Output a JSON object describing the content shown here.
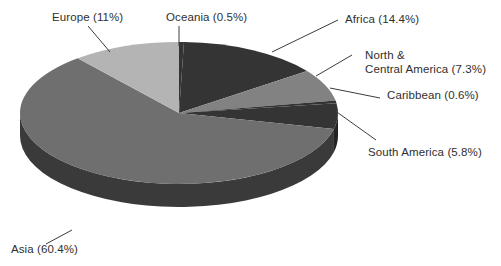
{
  "chart_data": {
    "type": "pie",
    "title": "",
    "subtitle": "",
    "xlabel": "",
    "ylabel": "",
    "legend_position": "none",
    "grid": false,
    "style": "3d-exploded-none",
    "start_angle_deg": 0,
    "direction": "clockwise",
    "units": "percent",
    "categories": [
      "Oceania",
      "Africa",
      "North & Central America",
      "Caribbean",
      "South America",
      "Asia",
      "Europe"
    ],
    "values": [
      0.5,
      14.4,
      7.3,
      0.6,
      5.8,
      60.4,
      11.0
    ],
    "slices": [
      {
        "name": "Oceania",
        "value": 0.5,
        "label": "Oceania (0.5%)",
        "value_text": "0.5%",
        "color": "#343434",
        "side_color": "#232323"
      },
      {
        "name": "Africa",
        "value": 14.4,
        "label": "Africa (14.4%)",
        "value_text": "14.4%",
        "color": "#343434",
        "side_color": "#232323"
      },
      {
        "name": "North & Central America",
        "value": 7.3,
        "label_line1": "North &",
        "label_line2": "Central America (7.3%)",
        "label": "North & Central America (7.3%)",
        "value_text": "7.3%",
        "color": "#828282",
        "side_color": "#5a5a5a"
      },
      {
        "name": "Caribbean",
        "value": 0.6,
        "label": "Caribbean (0.6%)",
        "value_text": "0.6%",
        "color": "#343434",
        "side_color": "#232323"
      },
      {
        "name": "South America",
        "value": 5.8,
        "label": "South America (5.8%)",
        "value_text": "5.8%",
        "color": "#343434",
        "side_color": "#232323"
      },
      {
        "name": "Asia",
        "value": 60.4,
        "label": "Asia (60.4%)",
        "value_text": "60.4%",
        "color": "#6f6f6f",
        "side_color": "#3a3a3a"
      },
      {
        "name": "Europe",
        "value": 11.0,
        "label": "Europe (11%)",
        "value_text": "11%",
        "color": "#b4b4b4",
        "side_color": "#7d7d7d"
      }
    ],
    "total": 100.0,
    "colors": {
      "background": "#ffffff",
      "text": "#2f2f2f",
      "leader_line": "#3c3c3c"
    }
  }
}
